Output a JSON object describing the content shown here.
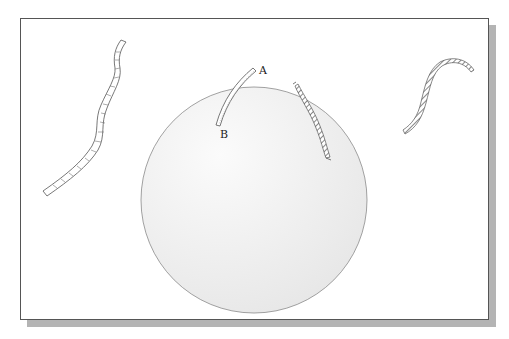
{
  "figure": {
    "labels": {
      "a": "A",
      "b": "B"
    },
    "colors": {
      "background": "#ffffff",
      "frame_border": "#555555",
      "shadow": "#b4b4b4",
      "circle_fill": "#eeeeee",
      "circle_stroke": "#888888",
      "strand_stroke": "#555555",
      "strand_hatch": "#999999"
    }
  }
}
